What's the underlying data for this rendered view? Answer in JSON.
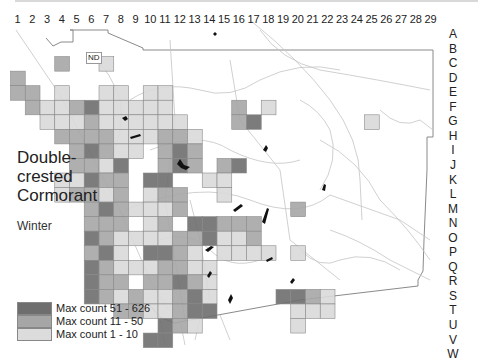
{
  "map": {
    "title_lines": [
      "Double-",
      "crested",
      "Cormorant"
    ],
    "season": "Winter",
    "no_data_label": "ND",
    "column_labels": [
      "1",
      "2",
      "3",
      "4",
      "5",
      "6",
      "7",
      "8",
      "9",
      "10",
      "11",
      "12",
      "13",
      "14",
      "15",
      "16",
      "17",
      "18",
      "19",
      "20",
      "21",
      "22",
      "23",
      "24",
      "25",
      "26",
      "27",
      "28",
      "29"
    ],
    "row_labels": [
      "A",
      "B",
      "C",
      "D",
      "E",
      "F",
      "G",
      "H",
      "I",
      "J",
      "K",
      "L",
      "M",
      "N",
      "O",
      "P",
      "Q",
      "R",
      "S",
      "T",
      "U",
      "V",
      "W"
    ],
    "colors": {
      "dark": "#6e6e6e",
      "medium": "#a6a6a6",
      "light": "#d9d9d9",
      "cell_border": "#8a8a8a",
      "roads": "#bdbdbd",
      "lakes": "#111111"
    },
    "legend": [
      {
        "label": "Max count 51 - 626",
        "level": "dark"
      },
      {
        "label": "Max count 11 - 50",
        "level": "medium"
      },
      {
        "label": "Max count 1 - 10",
        "level": "light"
      }
    ],
    "cells": [
      {
        "col": 4,
        "row": "C",
        "level": "medium"
      },
      {
        "col": 7,
        "row": "C",
        "level": "light"
      },
      {
        "col": 1,
        "row": "D",
        "level": "medium"
      },
      {
        "col": 1,
        "row": "E",
        "level": "medium"
      },
      {
        "col": 2,
        "row": "E",
        "level": "medium"
      },
      {
        "col": 4,
        "row": "E",
        "level": "light"
      },
      {
        "col": 7,
        "row": "E",
        "level": "light"
      },
      {
        "col": 8,
        "row": "E",
        "level": "light"
      },
      {
        "col": 10,
        "row": "E",
        "level": "light"
      },
      {
        "col": 11,
        "row": "E",
        "level": "light"
      },
      {
        "col": 2,
        "row": "F",
        "level": "medium"
      },
      {
        "col": 3,
        "row": "F",
        "level": "light"
      },
      {
        "col": 4,
        "row": "F",
        "level": "light"
      },
      {
        "col": 5,
        "row": "F",
        "level": "medium"
      },
      {
        "col": 6,
        "row": "F",
        "level": "dark"
      },
      {
        "col": 7,
        "row": "F",
        "level": "light"
      },
      {
        "col": 8,
        "row": "F",
        "level": "light"
      },
      {
        "col": 9,
        "row": "F",
        "level": "light"
      },
      {
        "col": 10,
        "row": "F",
        "level": "light"
      },
      {
        "col": 11,
        "row": "F",
        "level": "light"
      },
      {
        "col": 16,
        "row": "F",
        "level": "medium"
      },
      {
        "col": 18,
        "row": "F",
        "level": "light"
      },
      {
        "col": 3,
        "row": "G",
        "level": "light"
      },
      {
        "col": 4,
        "row": "G",
        "level": "light"
      },
      {
        "col": 5,
        "row": "G",
        "level": "light"
      },
      {
        "col": 6,
        "row": "G",
        "level": "medium"
      },
      {
        "col": 7,
        "row": "G",
        "level": "light"
      },
      {
        "col": 8,
        "row": "G",
        "level": "light"
      },
      {
        "col": 9,
        "row": "G",
        "level": "light"
      },
      {
        "col": 10,
        "row": "G",
        "level": "light"
      },
      {
        "col": 11,
        "row": "G",
        "level": "light"
      },
      {
        "col": 12,
        "row": "G",
        "level": "light"
      },
      {
        "col": 16,
        "row": "G",
        "level": "medium"
      },
      {
        "col": 17,
        "row": "G",
        "level": "dark"
      },
      {
        "col": 25,
        "row": "G",
        "level": "light"
      },
      {
        "col": 4,
        "row": "H",
        "level": "medium"
      },
      {
        "col": 5,
        "row": "H",
        "level": "medium"
      },
      {
        "col": 6,
        "row": "H",
        "level": "medium"
      },
      {
        "col": 7,
        "row": "H",
        "level": "medium"
      },
      {
        "col": 8,
        "row": "H",
        "level": "light"
      },
      {
        "col": 9,
        "row": "H",
        "level": "light"
      },
      {
        "col": 10,
        "row": "H",
        "level": "light"
      },
      {
        "col": 11,
        "row": "H",
        "level": "medium"
      },
      {
        "col": 12,
        "row": "H",
        "level": "medium"
      },
      {
        "col": 13,
        "row": "H",
        "level": "light"
      },
      {
        "col": 5,
        "row": "I",
        "level": "medium"
      },
      {
        "col": 6,
        "row": "I",
        "level": "dark"
      },
      {
        "col": 7,
        "row": "I",
        "level": "medium"
      },
      {
        "col": 8,
        "row": "I",
        "level": "light"
      },
      {
        "col": 9,
        "row": "I",
        "level": "light"
      },
      {
        "col": 11,
        "row": "I",
        "level": "medium"
      },
      {
        "col": 12,
        "row": "I",
        "level": "dark"
      },
      {
        "col": 13,
        "row": "I",
        "level": "medium"
      },
      {
        "col": 5,
        "row": "J",
        "level": "medium"
      },
      {
        "col": 6,
        "row": "J",
        "level": "medium"
      },
      {
        "col": 7,
        "row": "J",
        "level": "light"
      },
      {
        "col": 8,
        "row": "J",
        "level": "dark"
      },
      {
        "col": 11,
        "row": "J",
        "level": "medium"
      },
      {
        "col": 12,
        "row": "J",
        "level": "dark"
      },
      {
        "col": 13,
        "row": "J",
        "level": "medium"
      },
      {
        "col": 15,
        "row": "J",
        "level": "medium"
      },
      {
        "col": 16,
        "row": "J",
        "level": "dark"
      },
      {
        "col": 4,
        "row": "K",
        "level": "light"
      },
      {
        "col": 5,
        "row": "K",
        "level": "light"
      },
      {
        "col": 6,
        "row": "K",
        "level": "dark"
      },
      {
        "col": 7,
        "row": "K",
        "level": "medium"
      },
      {
        "col": 8,
        "row": "K",
        "level": "medium"
      },
      {
        "col": 10,
        "row": "K",
        "level": "dark"
      },
      {
        "col": 11,
        "row": "K",
        "level": "dark"
      },
      {
        "col": 14,
        "row": "K",
        "level": "light"
      },
      {
        "col": 15,
        "row": "K",
        "level": "light"
      },
      {
        "col": 4,
        "row": "L",
        "level": "light"
      },
      {
        "col": 5,
        "row": "L",
        "level": "medium"
      },
      {
        "col": 6,
        "row": "L",
        "level": "medium"
      },
      {
        "col": 7,
        "row": "L",
        "level": "light"
      },
      {
        "col": 8,
        "row": "L",
        "level": "medium"
      },
      {
        "col": 10,
        "row": "L",
        "level": "light"
      },
      {
        "col": 11,
        "row": "L",
        "level": "medium"
      },
      {
        "col": 12,
        "row": "L",
        "level": "medium"
      },
      {
        "col": 15,
        "row": "L",
        "level": "light"
      },
      {
        "col": 6,
        "row": "M",
        "level": "medium"
      },
      {
        "col": 7,
        "row": "M",
        "level": "dark"
      },
      {
        "col": 8,
        "row": "M",
        "level": "medium"
      },
      {
        "col": 9,
        "row": "M",
        "level": "light"
      },
      {
        "col": 10,
        "row": "M",
        "level": "light"
      },
      {
        "col": 11,
        "row": "M",
        "level": "light"
      },
      {
        "col": 12,
        "row": "M",
        "level": "medium"
      },
      {
        "col": 20,
        "row": "M",
        "level": "medium"
      },
      {
        "col": 6,
        "row": "N",
        "level": "medium"
      },
      {
        "col": 7,
        "row": "N",
        "level": "medium"
      },
      {
        "col": 8,
        "row": "N",
        "level": "medium"
      },
      {
        "col": 10,
        "row": "N",
        "level": "light"
      },
      {
        "col": 11,
        "row": "N",
        "level": "medium"
      },
      {
        "col": 13,
        "row": "N",
        "level": "dark"
      },
      {
        "col": 14,
        "row": "N",
        "level": "dark"
      },
      {
        "col": 15,
        "row": "N",
        "level": "medium"
      },
      {
        "col": 16,
        "row": "N",
        "level": "medium"
      },
      {
        "col": 17,
        "row": "N",
        "level": "medium"
      },
      {
        "col": 6,
        "row": "O",
        "level": "dark"
      },
      {
        "col": 7,
        "row": "O",
        "level": "medium"
      },
      {
        "col": 8,
        "row": "O",
        "level": "light"
      },
      {
        "col": 9,
        "row": "O",
        "level": "light"
      },
      {
        "col": 10,
        "row": "O",
        "level": "light"
      },
      {
        "col": 11,
        "row": "O",
        "level": "light"
      },
      {
        "col": 12,
        "row": "O",
        "level": "medium"
      },
      {
        "col": 13,
        "row": "O",
        "level": "medium"
      },
      {
        "col": 14,
        "row": "O",
        "level": "dark"
      },
      {
        "col": 15,
        "row": "O",
        "level": "light"
      },
      {
        "col": 16,
        "row": "O",
        "level": "light"
      },
      {
        "col": 17,
        "row": "O",
        "level": "medium"
      },
      {
        "col": 6,
        "row": "P",
        "level": "medium"
      },
      {
        "col": 7,
        "row": "P",
        "level": "dark"
      },
      {
        "col": 8,
        "row": "P",
        "level": "light"
      },
      {
        "col": 10,
        "row": "P",
        "level": "dark"
      },
      {
        "col": 11,
        "row": "P",
        "level": "dark"
      },
      {
        "col": 12,
        "row": "P",
        "level": "medium"
      },
      {
        "col": 13,
        "row": "P",
        "level": "light"
      },
      {
        "col": 15,
        "row": "P",
        "level": "light"
      },
      {
        "col": 16,
        "row": "P",
        "level": "light"
      },
      {
        "col": 17,
        "row": "P",
        "level": "light"
      },
      {
        "col": 18,
        "row": "P",
        "level": "light"
      },
      {
        "col": 20,
        "row": "P",
        "level": "light"
      },
      {
        "col": 6,
        "row": "Q",
        "level": "dark"
      },
      {
        "col": 7,
        "row": "Q",
        "level": "medium"
      },
      {
        "col": 8,
        "row": "Q",
        "level": "light"
      },
      {
        "col": 9,
        "row": "Q",
        "level": "light"
      },
      {
        "col": 10,
        "row": "Q",
        "level": "light"
      },
      {
        "col": 11,
        "row": "Q",
        "level": "medium"
      },
      {
        "col": 12,
        "row": "Q",
        "level": "medium"
      },
      {
        "col": 13,
        "row": "Q",
        "level": "light"
      },
      {
        "col": 14,
        "row": "Q",
        "level": "light"
      },
      {
        "col": 6,
        "row": "R",
        "level": "dark"
      },
      {
        "col": 7,
        "row": "R",
        "level": "medium"
      },
      {
        "col": 8,
        "row": "R",
        "level": "medium"
      },
      {
        "col": 10,
        "row": "R",
        "level": "medium"
      },
      {
        "col": 11,
        "row": "R",
        "level": "medium"
      },
      {
        "col": 12,
        "row": "R",
        "level": "dark"
      },
      {
        "col": 13,
        "row": "R",
        "level": "medium"
      },
      {
        "col": 14,
        "row": "R",
        "level": "light"
      },
      {
        "col": 6,
        "row": "S",
        "level": "dark"
      },
      {
        "col": 7,
        "row": "S",
        "level": "medium"
      },
      {
        "col": 8,
        "row": "S",
        "level": "light"
      },
      {
        "col": 9,
        "row": "S",
        "level": "medium"
      },
      {
        "col": 10,
        "row": "S",
        "level": "light"
      },
      {
        "col": 11,
        "row": "S",
        "level": "light"
      },
      {
        "col": 12,
        "row": "S",
        "level": "medium"
      },
      {
        "col": 13,
        "row": "S",
        "level": "dark"
      },
      {
        "col": 14,
        "row": "S",
        "level": "light"
      },
      {
        "col": 19,
        "row": "S",
        "level": "dark"
      },
      {
        "col": 20,
        "row": "S",
        "level": "dark"
      },
      {
        "col": 21,
        "row": "S",
        "level": "medium"
      },
      {
        "col": 22,
        "row": "S",
        "level": "light"
      },
      {
        "col": 8,
        "row": "T",
        "level": "medium"
      },
      {
        "col": 9,
        "row": "T",
        "level": "medium"
      },
      {
        "col": 10,
        "row": "T",
        "level": "light"
      },
      {
        "col": 11,
        "row": "T",
        "level": "light"
      },
      {
        "col": 12,
        "row": "T",
        "level": "medium"
      },
      {
        "col": 13,
        "row": "T",
        "level": "dark"
      },
      {
        "col": 14,
        "row": "T",
        "level": "dark"
      },
      {
        "col": 20,
        "row": "T",
        "level": "light"
      },
      {
        "col": 21,
        "row": "T",
        "level": "light"
      },
      {
        "col": 22,
        "row": "T",
        "level": "light"
      },
      {
        "col": 11,
        "row": "U",
        "level": "dark"
      },
      {
        "col": 12,
        "row": "U",
        "level": "medium"
      },
      {
        "col": 13,
        "row": "U",
        "level": "light"
      },
      {
        "col": 20,
        "row": "U",
        "level": "light"
      },
      {
        "col": 10,
        "row": "V",
        "level": "dark"
      },
      {
        "col": 11,
        "row": "V",
        "level": "dark"
      }
    ]
  }
}
